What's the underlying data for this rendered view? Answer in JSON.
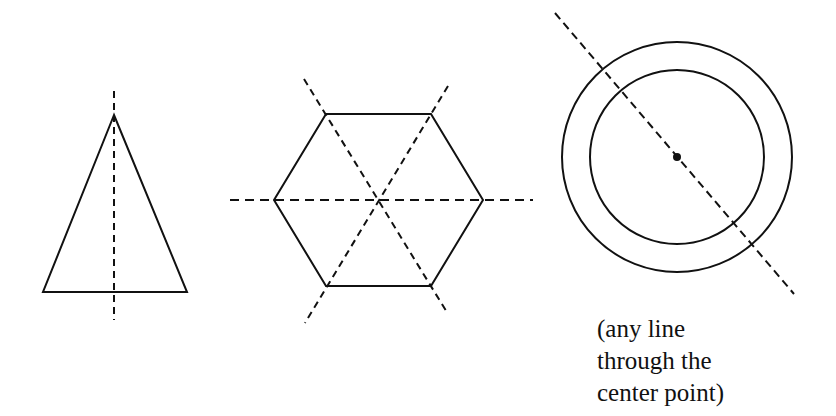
{
  "figure": {
    "stroke_color": "#111111",
    "shapes": [
      {
        "name": "isosceles-triangle",
        "symmetry_lines": 1
      },
      {
        "name": "regular-hexagon",
        "symmetry_lines_shown": 3
      },
      {
        "name": "concentric-circles",
        "symmetry_lines": "infinite"
      }
    ],
    "caption": {
      "line1": "(any line",
      "line2": "through the",
      "line3": "center point)"
    }
  }
}
